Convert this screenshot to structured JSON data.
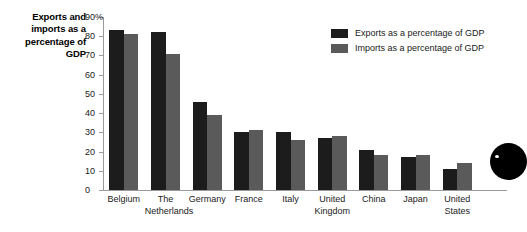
{
  "chart_title": "Exports and imports as a percentage of GDP",
  "legend": {
    "position": "top-right",
    "entries": [
      {
        "label": "Exports as a percentage of GDP",
        "color": "#1c1c1c",
        "swatch": "exports-swatch"
      },
      {
        "label": "Imports as a percentage of GDP",
        "color": "#5a5a5a",
        "swatch": "imports-swatch"
      }
    ]
  },
  "y_axis": {
    "top_label": "90%",
    "ticks": [
      "90%",
      "80",
      "70",
      "60",
      "50",
      "40",
      "30",
      "20",
      "10",
      "0"
    ],
    "tick_values": [
      90,
      80,
      70,
      60,
      50,
      40,
      30,
      20,
      10,
      0
    ],
    "min": 0,
    "max": 90
  },
  "chart_data": {
    "type": "bar",
    "title": "Exports and imports as a percentage of GDP",
    "xlabel": "",
    "ylabel": "",
    "ylim": [
      0,
      90
    ],
    "grid": false,
    "legend_position": "top-right",
    "categories": [
      "Belgium",
      "The Netherlands",
      "Germany",
      "France",
      "Italy",
      "United Kingdom",
      "China",
      "Japan",
      "United States"
    ],
    "category_lines": [
      [
        "Belgium"
      ],
      [
        "The",
        "Netherlands"
      ],
      [
        "Germany"
      ],
      [
        "France"
      ],
      [
        "Italy"
      ],
      [
        "United",
        "Kingdom"
      ],
      [
        "China"
      ],
      [
        "Japan"
      ],
      [
        "United",
        "States"
      ]
    ],
    "series": [
      {
        "name": "Exports as a percentage of GDP",
        "color": "#1c1c1c",
        "values": [
          83,
          82,
          46,
          30,
          30,
          27,
          21,
          17,
          11
        ]
      },
      {
        "name": "Imports as a percentage of GDP",
        "color": "#5a5a5a",
        "values": [
          81,
          71,
          39,
          31,
          26,
          28,
          18,
          18,
          14
        ]
      }
    ]
  },
  "artifact": {
    "name": "black-circle-artifact",
    "color": "#000000"
  }
}
